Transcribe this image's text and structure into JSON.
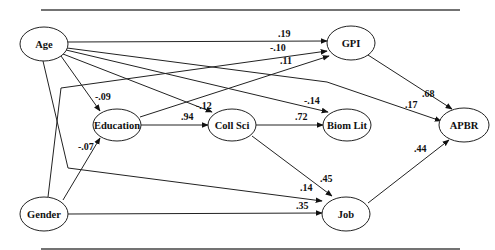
{
  "diagram": {
    "type": "path-model",
    "nodes": [
      {
        "id": "age",
        "label": "Age",
        "cx": 44,
        "cy": 44,
        "rx": 24,
        "ry": 17
      },
      {
        "id": "gpi",
        "label": "GPI",
        "cx": 351,
        "cy": 43,
        "rx": 24,
        "ry": 17
      },
      {
        "id": "education",
        "label": "Education",
        "cx": 117,
        "cy": 125,
        "rx": 24,
        "ry": 16
      },
      {
        "id": "collsci",
        "label": "Coll Sci",
        "cx": 232,
        "cy": 125,
        "rx": 24,
        "ry": 16
      },
      {
        "id": "biomlit",
        "label": "Biom Lit",
        "cx": 347,
        "cy": 125,
        "rx": 24,
        "ry": 16
      },
      {
        "id": "apbr",
        "label": "APBR",
        "cx": 464,
        "cy": 125,
        "rx": 25,
        "ry": 17
      },
      {
        "id": "gender",
        "label": "Gender",
        "cx": 44,
        "cy": 214,
        "rx": 24,
        "ry": 17
      },
      {
        "id": "job",
        "label": "Job",
        "cx": 346,
        "cy": 214,
        "rx": 24,
        "ry": 17
      }
    ],
    "edges": [
      {
        "from": "Age",
        "to": "GPI",
        "coef": ".19",
        "path": "M68,42 L327,41",
        "lx": 278,
        "ly": 37
      },
      {
        "from": "Gender",
        "to": "GPI",
        "coef": "-.10",
        "path": "M48,197 L61,88 L327,51",
        "lx": 270,
        "ly": 51
      },
      {
        "from": "Education",
        "to": "GPI",
        "coef": ".11",
        "path": "M140,117 L329,56",
        "lx": 280,
        "ly": 64
      },
      {
        "from": "Age",
        "to": "Education",
        "coef": "-.09",
        "path": "M61,56 L100,111",
        "lx": 95,
        "ly": 100
      },
      {
        "from": "Age",
        "to": "Coll Sci",
        "coef": "-.12",
        "path": "M63,54 L212,112",
        "lx": 196,
        "ly": 109
      },
      {
        "from": "Age",
        "to": "Biom Lit",
        "coef": "-.14",
        "path": "M66,50 L328,112",
        "lx": 304,
        "ly": 104
      },
      {
        "from": "Age",
        "to": "APBR",
        "coef": ".17",
        "path": "M67,48 L327,82 L441,121",
        "lx": 405,
        "ly": 108
      },
      {
        "from": "Education",
        "to": "Coll Sci",
        "coef": ".94",
        "path": "M141,125 L208,125",
        "lx": 181,
        "ly": 120
      },
      {
        "from": "Coll Sci",
        "to": "Biom Lit",
        "coef": ".72",
        "path": "M256,125 L323,125",
        "lx": 295,
        "ly": 120
      },
      {
        "from": "Coll Sci",
        "to": "Job",
        "coef": ".45",
        "path": "M252,136 L332,196",
        "lx": 320,
        "ly": 182
      },
      {
        "from": "Gender",
        "to": "Education",
        "coef": "-.07",
        "path": "M63,200 L100,138",
        "lx": 78,
        "ly": 150
      },
      {
        "from": "Age",
        "to": "Job",
        "coef": ".14",
        "path": "M43,61 L68,168 L322,201",
        "lx": 300,
        "ly": 191
      },
      {
        "from": "Gender",
        "to": "Job",
        "coef": ".35",
        "path": "M68,214 L322,213",
        "lx": 296,
        "ly": 209
      },
      {
        "from": "GPI",
        "to": "APBR",
        "coef": ".68",
        "path": "M368,55 L452,109",
        "lx": 422,
        "ly": 97
      },
      {
        "from": "Job",
        "to": "APBR",
        "coef": ".44",
        "path": "M368,203 L449,140",
        "lx": 414,
        "ly": 152
      }
    ],
    "rules": {
      "top_y": 10,
      "bottom_y": 249,
      "x1": 41,
      "x2": 460
    }
  }
}
